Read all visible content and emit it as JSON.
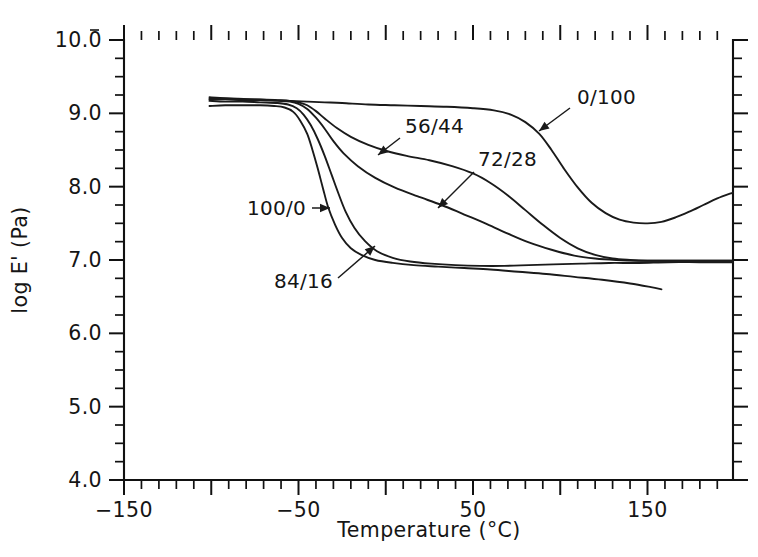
{
  "figure": {
    "background": "#ffffff",
    "ink_color": "#151515",
    "width": 758,
    "height": 557
  },
  "chart_data": {
    "type": "line",
    "title": "",
    "subtitle": "",
    "xlabel": "Temperature  (°C)",
    "ylabel": "log E' (Pa)",
    "xlim": [
      -150,
      199
    ],
    "ylim": [
      4.0,
      10.0
    ],
    "grid": false,
    "legend_position": "inline-annotations",
    "x_ticks_major": [
      -150,
      -100,
      -50,
      0,
      50,
      100,
      150
    ],
    "x_ticks_labeled": [
      {
        "value": -150,
        "label": "-150"
      },
      {
        "value": -50,
        "label": "-50"
      },
      {
        "value": 50,
        "label": "50"
      },
      {
        "value": 150,
        "label": "150"
      }
    ],
    "x_tick_minor_step": 10,
    "y_ticks_major": [
      4.0,
      5.0,
      6.0,
      7.0,
      8.0,
      9.0,
      10.0
    ],
    "y_ticks_labeled": [
      {
        "value": 10.0,
        "label": "10.0"
      },
      {
        "value": 9.0,
        "label": "9.0"
      },
      {
        "value": 8.0,
        "label": "8.0"
      },
      {
        "value": 7.0,
        "label": "7.0"
      },
      {
        "value": 6.0,
        "label": "6.0"
      },
      {
        "value": 5.0,
        "label": "5.0"
      },
      {
        "value": 4.0,
        "label": "4.0"
      }
    ],
    "y_tick_minor_step": 0.25,
    "series": [
      {
        "name": "0/100",
        "label": "0/100",
        "points": [
          [
            -101,
            9.22
          ],
          [
            -95,
            9.21
          ],
          [
            -85,
            9.2
          ],
          [
            -75,
            9.19
          ],
          [
            -65,
            9.18
          ],
          [
            -55,
            9.17
          ],
          [
            -45,
            9.16
          ],
          [
            -35,
            9.15
          ],
          [
            -25,
            9.14
          ],
          [
            -10,
            9.12
          ],
          [
            5,
            9.11
          ],
          [
            20,
            9.1
          ],
          [
            35,
            9.09
          ],
          [
            50,
            9.07
          ],
          [
            62,
            9.04
          ],
          [
            72,
            8.98
          ],
          [
            80,
            8.88
          ],
          [
            88,
            8.72
          ],
          [
            95,
            8.5
          ],
          [
            102,
            8.25
          ],
          [
            110,
            7.99
          ],
          [
            118,
            7.78
          ],
          [
            126,
            7.64
          ],
          [
            134,
            7.55
          ],
          [
            142,
            7.51
          ],
          [
            150,
            7.5
          ],
          [
            158,
            7.52
          ],
          [
            166,
            7.58
          ],
          [
            174,
            7.66
          ],
          [
            182,
            7.75
          ],
          [
            190,
            7.84
          ],
          [
            199,
            7.92
          ]
        ]
      },
      {
        "name": "56/44",
        "label": "56/44",
        "points": [
          [
            -101,
            9.2
          ],
          [
            -92,
            9.2
          ],
          [
            -82,
            9.19
          ],
          [
            -72,
            9.19
          ],
          [
            -62,
            9.18
          ],
          [
            -55,
            9.17
          ],
          [
            -50,
            9.15
          ],
          [
            -45,
            9.11
          ],
          [
            -40,
            9.03
          ],
          [
            -35,
            8.93
          ],
          [
            -28,
            8.8
          ],
          [
            -20,
            8.68
          ],
          [
            -10,
            8.57
          ],
          [
            0,
            8.49
          ],
          [
            12,
            8.42
          ],
          [
            25,
            8.36
          ],
          [
            38,
            8.28
          ],
          [
            50,
            8.18
          ],
          [
            60,
            8.05
          ],
          [
            70,
            7.88
          ],
          [
            80,
            7.68
          ],
          [
            90,
            7.48
          ],
          [
            100,
            7.3
          ],
          [
            110,
            7.16
          ],
          [
            120,
            7.07
          ],
          [
            130,
            7.02
          ],
          [
            140,
            7.0
          ],
          [
            150,
            6.99
          ],
          [
            165,
            6.99
          ],
          [
            180,
            6.99
          ],
          [
            199,
            6.99
          ]
        ]
      },
      {
        "name": "72/28",
        "label": "72/28",
        "points": [
          [
            -101,
            9.19
          ],
          [
            -92,
            9.19
          ],
          [
            -82,
            9.18
          ],
          [
            -72,
            9.18
          ],
          [
            -62,
            9.17
          ],
          [
            -55,
            9.16
          ],
          [
            -50,
            9.13
          ],
          [
            -45,
            9.06
          ],
          [
            -40,
            8.94
          ],
          [
            -35,
            8.79
          ],
          [
            -30,
            8.62
          ],
          [
            -24,
            8.45
          ],
          [
            -16,
            8.28
          ],
          [
            -6,
            8.12
          ],
          [
            5,
            7.99
          ],
          [
            18,
            7.87
          ],
          [
            32,
            7.75
          ],
          [
            45,
            7.62
          ],
          [
            58,
            7.49
          ],
          [
            70,
            7.36
          ],
          [
            82,
            7.24
          ],
          [
            95,
            7.14
          ],
          [
            108,
            7.06
          ],
          [
            120,
            7.02
          ],
          [
            132,
            7.0
          ],
          [
            145,
            6.99
          ],
          [
            160,
            6.99
          ],
          [
            175,
            6.99
          ],
          [
            199,
            6.99
          ]
        ]
      },
      {
        "name": "84/16",
        "label": "84/16",
        "points": [
          [
            -101,
            9.17
          ],
          [
            -92,
            9.16
          ],
          [
            -82,
            9.16
          ],
          [
            -72,
            9.15
          ],
          [
            -62,
            9.14
          ],
          [
            -56,
            9.12
          ],
          [
            -51,
            9.07
          ],
          [
            -47,
            8.98
          ],
          [
            -43,
            8.84
          ],
          [
            -39,
            8.65
          ],
          [
            -35,
            8.42
          ],
          [
            -31,
            8.16
          ],
          [
            -27,
            7.9
          ],
          [
            -23,
            7.66
          ],
          [
            -18,
            7.44
          ],
          [
            -12,
            7.26
          ],
          [
            -5,
            7.12
          ],
          [
            4,
            7.03
          ],
          [
            14,
            6.98
          ],
          [
            26,
            6.95
          ],
          [
            40,
            6.93
          ],
          [
            54,
            6.92
          ],
          [
            68,
            6.92
          ],
          [
            82,
            6.93
          ],
          [
            96,
            6.94
          ],
          [
            112,
            6.95
          ],
          [
            128,
            6.96
          ],
          [
            145,
            6.96
          ],
          [
            162,
            6.97
          ],
          [
            180,
            6.97
          ],
          [
            199,
            6.97
          ]
        ]
      },
      {
        "name": "100/0",
        "label": "100/0",
        "points": [
          [
            -101,
            9.1
          ],
          [
            -92,
            9.11
          ],
          [
            -82,
            9.11
          ],
          [
            -72,
            9.11
          ],
          [
            -64,
            9.1
          ],
          [
            -58,
            9.08
          ],
          [
            -53,
            9.02
          ],
          [
            -49,
            8.9
          ],
          [
            -45,
            8.72
          ],
          [
            -42,
            8.5
          ],
          [
            -39,
            8.25
          ],
          [
            -36,
            7.98
          ],
          [
            -33,
            7.72
          ],
          [
            -29,
            7.48
          ],
          [
            -25,
            7.3
          ],
          [
            -20,
            7.16
          ],
          [
            -14,
            7.07
          ],
          [
            -6,
            7.0
          ],
          [
            4,
            6.96
          ],
          [
            16,
            6.93
          ],
          [
            30,
            6.91
          ],
          [
            45,
            6.89
          ],
          [
            60,
            6.87
          ],
          [
            76,
            6.84
          ],
          [
            92,
            6.81
          ],
          [
            108,
            6.77
          ],
          [
            124,
            6.73
          ],
          [
            140,
            6.68
          ],
          [
            152,
            6.63
          ],
          [
            158,
            6.6
          ]
        ]
      }
    ],
    "annotations": [
      {
        "id": "ann-0-100",
        "text": "0/100",
        "text_x": 577,
        "text_y": 104,
        "anchor": "start",
        "leader_from": [
          570,
          108
        ],
        "leader_to": [
          539,
          131
        ],
        "has_arrow": true
      },
      {
        "id": "ann-56-44",
        "text": "56/44",
        "text_x": 405,
        "text_y": 133,
        "anchor": "start",
        "leader_from": [
          400,
          138
        ],
        "leader_to": [
          378,
          155
        ],
        "has_arrow": true
      },
      {
        "id": "ann-72-28",
        "text": "72/28",
        "text_x": 478,
        "text_y": 166,
        "anchor": "start",
        "leader_from": [
          474,
          172
        ],
        "leader_to": [
          438,
          208
        ],
        "has_arrow": true
      },
      {
        "id": "ann-100-0",
        "text": "100/0",
        "text_x": 247,
        "text_y": 215,
        "anchor": "start",
        "leader_from": [
          312,
          208
        ],
        "leader_to": [
          330,
          208
        ],
        "has_arrow": true
      },
      {
        "id": "ann-84-16",
        "text": "84/16",
        "text_x": 274,
        "text_y": 288,
        "anchor": "start",
        "leader_from": [
          338,
          278
        ],
        "leader_to": [
          375,
          246
        ],
        "has_arrow": true
      }
    ]
  }
}
